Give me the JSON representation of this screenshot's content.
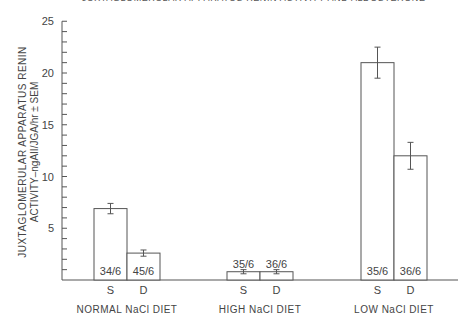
{
  "chart_data": {
    "type": "bar",
    "title": "JUXTAGLOMERULAR APPARATUS RENIN ACTIVITY AND ALDOSTERONE",
    "ylabel_line1": "JUXTAGLOMERULAR APPARATUS RENIN",
    "ylabel_line2": "ACTIVITY–ngAII/JGA/hr ± SEM",
    "xlabel": "",
    "ylim": [
      0,
      25
    ],
    "yticks": [
      5,
      10,
      15,
      20,
      25
    ],
    "grid": false,
    "groups": [
      {
        "label": "NORMAL NaCl DIET",
        "bars": [
          {
            "category": "S",
            "value": 6.9,
            "sem": 0.5,
            "n_label": "34/6"
          },
          {
            "category": "D",
            "value": 2.6,
            "sem": 0.3,
            "n_label": "45/6"
          }
        ]
      },
      {
        "label": "HIGH NaCl DIET",
        "bars": [
          {
            "category": "S",
            "value": 0.8,
            "sem": 0.2,
            "n_label": "35/6"
          },
          {
            "category": "D",
            "value": 0.8,
            "sem": 0.2,
            "n_label": "36/6"
          }
        ]
      },
      {
        "label": "LOW NaCl DIET",
        "bars": [
          {
            "category": "S",
            "value": 21.0,
            "sem": 1.5,
            "n_label": "35/6"
          },
          {
            "category": "D",
            "value": 12.0,
            "sem": 1.3,
            "n_label": "36/6"
          }
        ]
      }
    ]
  }
}
